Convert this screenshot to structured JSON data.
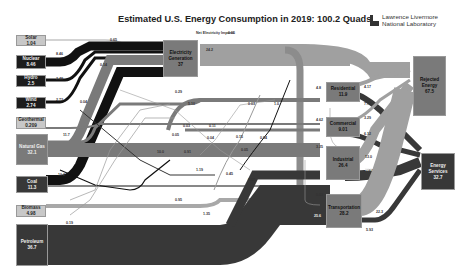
{
  "title": "Estimated U.S. Energy Consumption in 2019: 100.2 Quads",
  "logo": {
    "line1": "Lawrence Livermore",
    "line2": "National Laboratory"
  },
  "sources": [
    {
      "name": "Solar",
      "value": "1.04"
    },
    {
      "name": "Nuclear",
      "value": "8.46"
    },
    {
      "name": "Hydro",
      "value": "2.5"
    },
    {
      "name": "Wind",
      "value": "2.74"
    },
    {
      "name": "Geothermal",
      "value": "0.209"
    },
    {
      "name": "Natural Gas",
      "value": "32.1"
    },
    {
      "name": "Coal",
      "value": "11.3"
    },
    {
      "name": "Biomass",
      "value": "4.98"
    },
    {
      "name": "Petroleum",
      "value": "36.7"
    }
  ],
  "electricity": {
    "name": "Electricity Generation",
    "value": "37",
    "net_imports_label": "Net Electricity Imports",
    "net_imports_value": "0.05",
    "loss": "24.2"
  },
  "sectors": [
    {
      "name": "Residential",
      "value": "11.9",
      "in_elec": "4.8",
      "rejected": "4.17",
      "services": "7.74"
    },
    {
      "name": "Commercial",
      "value": "9.01",
      "in_elec": "4.62",
      "rejected": "3.29",
      "services": "6.12"
    },
    {
      "name": "Industrial",
      "value": "26.4",
      "in_elec": "3.25",
      "rejected": "13.0",
      "services": "12.8"
    },
    {
      "name": "Transportation",
      "value": "28.2",
      "in_elec": "0.03",
      "rejected": "22.3",
      "services": "5.93"
    }
  ],
  "sinks": [
    {
      "name": "Rejected Energy",
      "value": "67.5"
    },
    {
      "name": "Energy Services",
      "value": "32.7"
    }
  ],
  "flow_labels": {
    "solar_elec": "0.65",
    "nuclear_elec": "8.46",
    "hydro_elec": "2.48",
    "wind_elec": "2.73",
    "geo_elec": "0.04",
    "gas_elec": "11.7",
    "coal_elec": "10.2",
    "solar_res": "0.29",
    "solar_com": "0.14",
    "elec_res": "5.10",
    "gas_res": "0.03",
    "elec_com": "0.03",
    "gas_ind": "10.0",
    "geo_res": "0.11",
    "gas_com": "0.05",
    "coal_ind": "0.91",
    "bio_res": "0.04",
    "gas_trans": "1.0",
    "bio_com": "0.15",
    "gas_ind2": "0.84",
    "bio_ind": "0.05",
    "pet_ind": "1.19",
    "bio_elec": "0.45",
    "pet_elec": "0.19",
    "pet_res": "0.97",
    "pet_com": "0.95",
    "bio_trans": "1.35",
    "pet_trans": "25.6"
  }
}
